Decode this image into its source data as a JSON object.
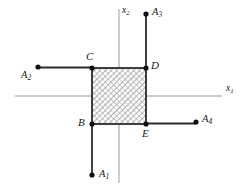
{
  "figure": {
    "type": "geometric-diagram",
    "colors": {
      "axis": "#9a9a9a",
      "segment": "#2b2b2b",
      "point": "#111111",
      "hatch": "#8e8e8e",
      "hatch_fill": "#ffffff",
      "background": "#ffffff",
      "text": "#1a1a1a"
    },
    "axes": {
      "x_axis": {
        "label": "x",
        "sub": "1"
      },
      "y_axis": {
        "label": "x",
        "sub": "2"
      }
    },
    "vertices": [
      {
        "id": "C",
        "label": "C",
        "x": 92,
        "y": 68,
        "label_x": 86,
        "label_y": 52
      },
      {
        "id": "D",
        "label": "D",
        "x": 146,
        "y": 68,
        "label_x": 151,
        "label_y": 62
      },
      {
        "id": "B",
        "label": "B",
        "x": 92,
        "y": 124,
        "label_x": 79,
        "label_y": 118
      },
      {
        "id": "E",
        "label": "E",
        "x": 146,
        "y": 124,
        "label_x": 142,
        "label_y": 128
      }
    ],
    "external_points": [
      {
        "id": "A1",
        "label": "A",
        "sub": "1",
        "x": 92,
        "y": 175,
        "label_x": 99,
        "label_y": 170
      },
      {
        "id": "A2",
        "label": "A",
        "sub": "2",
        "x": 38,
        "y": 67,
        "label_x": 22,
        "label_y": 69
      },
      {
        "id": "A3",
        "label": "A",
        "sub": "3",
        "x": 146,
        "y": 14,
        "label_x": 153,
        "label_y": 8
      },
      {
        "id": "A4",
        "label": "A",
        "sub": "4",
        "x": 196,
        "y": 122,
        "label_x": 203,
        "label_y": 115
      }
    ],
    "rectangle": {
      "left": 92,
      "top": 68,
      "right": 146,
      "bottom": 124,
      "hatched": true
    },
    "segments": [
      {
        "from": "A2",
        "to": "C",
        "orientation": "horizontal"
      },
      {
        "from": "A3",
        "to": "D",
        "orientation": "vertical"
      },
      {
        "from": "A1",
        "to": "B",
        "orientation": "vertical"
      },
      {
        "from": "E",
        "to": "A4",
        "orientation": "horizontal"
      }
    ]
  }
}
